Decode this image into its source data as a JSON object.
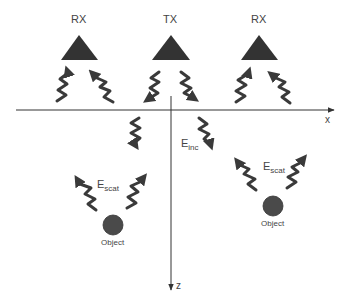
{
  "diagram": {
    "antennas": [
      {
        "role": "receiver",
        "label": "RX"
      },
      {
        "role": "transmitter",
        "label": "TX"
      },
      {
        "role": "receiver",
        "label": "RX"
      }
    ],
    "axes": {
      "x_label": "x",
      "z_label": "z"
    },
    "fields": {
      "incident": {
        "base": "E",
        "subscript": "inc"
      },
      "scattered_left": {
        "base": "E",
        "subscript": "scat"
      },
      "scattered_right": {
        "base": "E",
        "subscript": "scat"
      }
    },
    "objects": [
      {
        "label": "Object"
      },
      {
        "label": "Object"
      }
    ],
    "colors": {
      "triangle": "#333333",
      "wave": "#3a3a3a",
      "axis": "#333333",
      "object": "#4a4a4a",
      "text": "#444444"
    }
  }
}
